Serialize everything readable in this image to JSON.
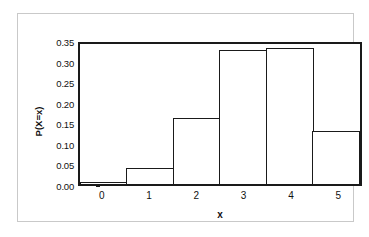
{
  "chart_data": {
    "type": "bar",
    "title": "",
    "xlabel": "x",
    "ylabel": "P(X=x)",
    "categories": [
      "0",
      "1",
      "2",
      "3",
      "4",
      "5"
    ],
    "values": [
      0.0,
      0.04,
      0.16,
      0.325,
      0.33,
      0.13
    ],
    "ylim": [
      0.0,
      0.35
    ],
    "ytick_labels": [
      "0.35",
      "0.30",
      "0.25",
      "0.20",
      "0.15",
      "0.10",
      "0.05",
      "0.00"
    ],
    "ytick_values": [
      0.35,
      0.3,
      0.25,
      0.2,
      0.15,
      0.1,
      0.05,
      0.0
    ],
    "ystep": 0.05,
    "grid": false,
    "legend": "none",
    "bar_fill_color": "#ffffff",
    "bar_edge_color": "#1a1a1a",
    "axis_color": "#1a1a1a",
    "frame_color": "#c9c9c9",
    "background_color": "#ffffff"
  }
}
